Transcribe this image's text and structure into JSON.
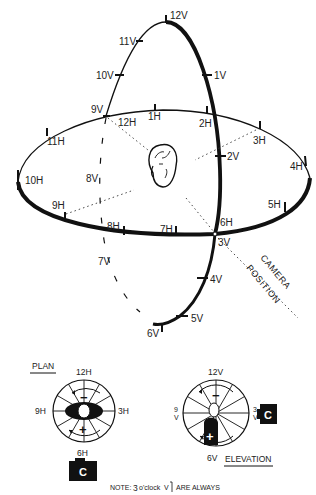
{
  "main_diagram": {
    "vertical_labels": {
      "v12": "12V",
      "v11": "11V",
      "v10": "10V",
      "v9": "9V",
      "v1": "1V",
      "v2": "2V",
      "v3": "3V",
      "v4": "4V",
      "v5": "5V",
      "v6": "6V",
      "v7": "7V",
      "v8": "8V"
    },
    "horizontal_labels": {
      "h12": "12H",
      "h1": "1H",
      "h2": "2H",
      "h3": "3H",
      "h4": "4H",
      "h5": "5H",
      "h6": "6H",
      "h7": "7H",
      "h8": "8H",
      "h9": "9H",
      "h10": "10H",
      "h11": "11H"
    },
    "camera_position": {
      "line1": "CAMERA",
      "line2": "POSITION"
    }
  },
  "plan_view": {
    "title": "PLAN",
    "top": "12H",
    "left": "9H",
    "right": "3H",
    "bottom": "6H",
    "minus": "−",
    "plus": "+",
    "camera": "C"
  },
  "elevation_view": {
    "title": "ELEVATION",
    "top": "12V",
    "left_top": "9",
    "left_bottom": "V",
    "right_top": "3",
    "right_bottom": "V",
    "bottom": "6V",
    "minus": "−",
    "plus": "+",
    "camera": "C"
  },
  "note": {
    "prefix": "NOTE:",
    "three": "3",
    "oclock": "o'clock",
    "v": "V",
    "suffix": "ARE ALWAYS"
  }
}
